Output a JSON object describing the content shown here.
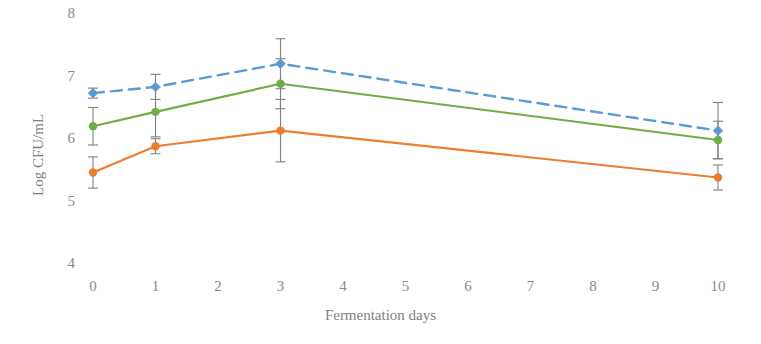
{
  "chart_data": {
    "type": "line",
    "title": "",
    "xlabel": "Fermentation days",
    "ylabel": "Log CFU/mL",
    "xlim": [
      0,
      10
    ],
    "ylim": [
      4,
      8
    ],
    "xticks": [
      0,
      1,
      2,
      3,
      4,
      5,
      6,
      7,
      8,
      9,
      10
    ],
    "xtick_labels": [
      "0",
      "1",
      "2",
      "3",
      "4",
      "5",
      "6",
      "7",
      "8",
      "9",
      "10"
    ],
    "yticks": [
      4,
      5,
      6,
      7,
      8
    ],
    "ytick_labels": [
      "4",
      "5",
      "6",
      "7",
      "8"
    ],
    "grid": false,
    "legend": "none",
    "x": [
      0,
      1,
      3,
      10
    ],
    "series": [
      {
        "name": "series-blue",
        "color": "#5b9bd5",
        "linestyle": "dashed",
        "marker": "diamond",
        "values": [
          6.75,
          6.85,
          7.22,
          6.15
        ],
        "errors": [
          0.08,
          0.2,
          0.4,
          0.45
        ]
      },
      {
        "name": "series-green",
        "color": "#70ad47",
        "linestyle": "solid",
        "marker": "circle",
        "values": [
          6.22,
          6.45,
          6.9,
          6.0
        ],
        "errors": [
          0.3,
          0.4,
          0.4,
          0.3
        ]
      },
      {
        "name": "series-orange",
        "color": "#ed7d31",
        "linestyle": "solid",
        "marker": "circle",
        "values": [
          5.48,
          5.9,
          6.15,
          5.4
        ],
        "errors": [
          0.25,
          0.12,
          0.5,
          0.2
        ]
      }
    ],
    "errorbar_color": "#808080",
    "tick_color": "#8a8a8a"
  }
}
